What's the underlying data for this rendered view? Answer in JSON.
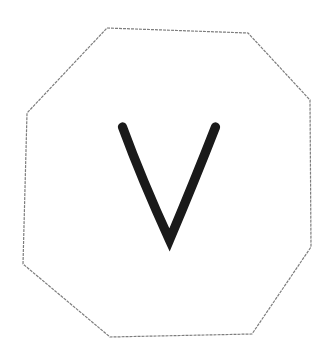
{
  "canvas": {
    "background": "#ffffff",
    "width": "331",
    "height": "359"
  },
  "sketch": {
    "octagon": {
      "points": "107,28 248,33 310,100 311,247 252,334 110,337 23,264 27,113",
      "stroke_color": "#7d7d7d",
      "stroke_width": "1.2",
      "dash": "3 1"
    },
    "letter_v": {
      "path": "M 122.5,127 Q 142,180 169.5,240 Q 194,182 215.5,127",
      "stroke_color": "#1a1a1a",
      "stroke_width": "9.3"
    }
  }
}
